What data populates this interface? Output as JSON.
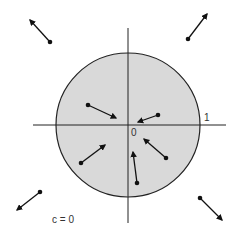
{
  "diagram": {
    "caption": "c = 0",
    "labels": {
      "origin": "0",
      "unit": "1"
    },
    "disk": {
      "cx": 128,
      "cy": 125,
      "r": 72,
      "fill": "#d9d9d9",
      "stroke": "#222222"
    },
    "axes": {
      "horizontal": {
        "x1": 33,
        "y1": 125,
        "x2": 226,
        "y2": 125
      },
      "vertical": {
        "x1": 128,
        "y1": 28,
        "x2": 128,
        "y2": 223
      }
    },
    "arrows": [
      {
        "id": "outer-top-left",
        "from": [
          50,
          42
        ],
        "to": [
          30,
          20
        ],
        "region": "outside"
      },
      {
        "id": "outer-top-right",
        "from": [
          188,
          39
        ],
        "to": [
          207,
          14
        ],
        "region": "outside"
      },
      {
        "id": "inner-upper-left",
        "from": [
          88,
          105
        ],
        "to": [
          116,
          118
        ],
        "region": "inside"
      },
      {
        "id": "inner-upper-right",
        "from": [
          158,
          115
        ],
        "to": [
          138,
          122
        ],
        "region": "inside"
      },
      {
        "id": "inner-lower-left",
        "from": [
          81,
          163
        ],
        "to": [
          105,
          145
        ],
        "region": "inside"
      },
      {
        "id": "inner-lower-right",
        "from": [
          166,
          158
        ],
        "to": [
          144,
          139
        ],
        "region": "inside"
      },
      {
        "id": "inner-bottom",
        "from": [
          137,
          183
        ],
        "to": [
          133,
          152
        ],
        "region": "inside"
      },
      {
        "id": "outer-bottom-left",
        "from": [
          40,
          192
        ],
        "to": [
          17,
          210
        ],
        "region": "outside"
      },
      {
        "id": "outer-bottom-right",
        "from": [
          200,
          198
        ],
        "to": [
          222,
          220
        ],
        "region": "outside"
      }
    ]
  }
}
